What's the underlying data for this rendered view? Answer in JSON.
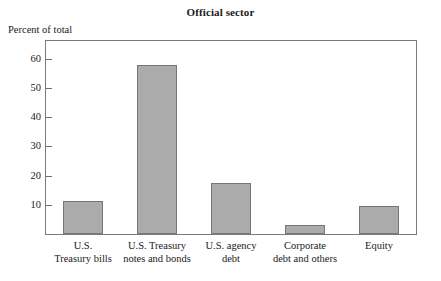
{
  "chart_data": {
    "type": "bar",
    "title": "Official sector",
    "xlabel": "",
    "ylabel": "Percent of total",
    "categories": [
      "U.S.\nTreasury bills",
      "U.S. Treasury\nnotes and bonds",
      "U.S. agency\ndebt",
      "Corporate\ndebt and others",
      "Equity"
    ],
    "category_lines": [
      [
        "U.S.",
        "Treasury bills"
      ],
      [
        "U.S. Treasury",
        "notes and bonds"
      ],
      [
        "U.S. agency",
        "debt"
      ],
      [
        "Corporate",
        "debt and others"
      ],
      [
        "Equity"
      ]
    ],
    "values": [
      11.3,
      57.8,
      17.5,
      3.0,
      9.5
    ],
    "ylim": [
      0,
      66
    ],
    "yticks": [
      10,
      20,
      30,
      40,
      50,
      60
    ],
    "ytick_labels": [
      "10",
      "20",
      "30",
      "40",
      "50",
      "60"
    ],
    "grid": false,
    "legend": false,
    "bar_fill": "#ababab",
    "bar_border": "#777777",
    "frame_color": "#7a7a7a"
  }
}
